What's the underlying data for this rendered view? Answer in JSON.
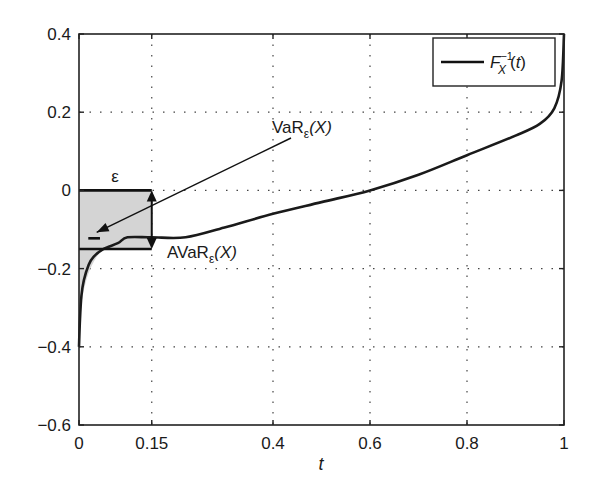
{
  "chart_data": {
    "type": "line",
    "title": "",
    "xlabel": "t",
    "ylabel": "",
    "xlim": [
      0,
      1
    ],
    "ylim": [
      -0.6,
      0.4
    ],
    "grid": true,
    "grid_style": "dotted",
    "legend_position": "upper right",
    "x_ticks": [
      0,
      0.15,
      0.4,
      0.6,
      0.8,
      1
    ],
    "x_tick_labels": [
      "0",
      "0.15",
      "0.4",
      "0.6",
      "0.8",
      "1"
    ],
    "y_ticks": [
      -0.6,
      -0.4,
      -0.2,
      0,
      0.2,
      0.4
    ],
    "y_tick_labels": [
      "−0.6",
      "−0.4",
      "−0.2",
      "0",
      "0.2",
      "0.4"
    ],
    "series": [
      {
        "name": "F_X^{-1}(t)",
        "legend_label": "Fₓ⁻¹(t)",
        "color": "#1a1a1a",
        "x": [
          0.0,
          0.002,
          0.005,
          0.01,
          0.02,
          0.03,
          0.05,
          0.08,
          0.1,
          0.15,
          0.22,
          0.3,
          0.4,
          0.5,
          0.6,
          0.7,
          0.8,
          0.9,
          0.95,
          0.98,
          0.995,
          1.0
        ],
        "y": [
          -0.4,
          -0.33,
          -0.27,
          -0.23,
          -0.19,
          -0.17,
          -0.15,
          -0.135,
          -0.12,
          -0.12,
          -0.12,
          -0.095,
          -0.06,
          -0.03,
          0.0,
          0.04,
          0.09,
          0.14,
          0.17,
          0.21,
          0.28,
          0.4
        ]
      }
    ],
    "annotations": [
      {
        "type": "shaded_rect",
        "label": "ε",
        "x_range": [
          0,
          0.15
        ],
        "y_range": [
          -0.15,
          0
        ],
        "fill": "#d4d4d4"
      },
      {
        "type": "shaded_area_under_curve",
        "x_range": [
          0,
          0.05
        ],
        "y_range": [
          -0.37,
          -0.15
        ],
        "fill": "#d4d4d4"
      },
      {
        "type": "text_arrow",
        "label": "VaRε(X)",
        "text_at": [
          0.38,
          0.18
        ],
        "arrow_to": [
          0.02,
          -0.12
        ]
      },
      {
        "type": "text",
        "label": "AVaRε(X)",
        "at": [
          0.18,
          -0.17
        ]
      },
      {
        "type": "double_arrow",
        "x": 0.15,
        "y_range": [
          -0.15,
          0
        ]
      },
      {
        "type": "marker_dash",
        "x_range": [
          0.015,
          0.035
        ],
        "y": -0.12
      }
    ]
  },
  "labels": {
    "epsilon": "ε",
    "var_main": "VaR",
    "var_sub": "ε",
    "var_tail": "(X)",
    "avar_main": "AVaR",
    "avar_sub": "ε",
    "avar_tail": "(X)",
    "legend_main": "F",
    "legend_sub": "X",
    "legend_sup": "−1",
    "legend_tail": "(t)",
    "xlabel": "t"
  }
}
